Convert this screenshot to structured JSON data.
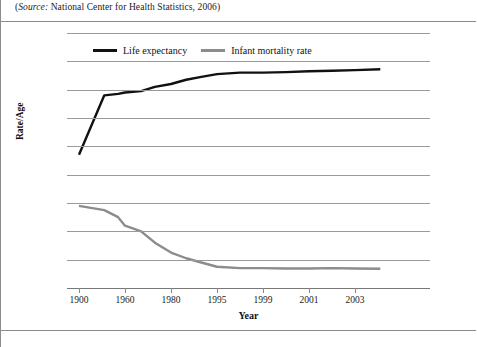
{
  "source_note": {
    "prefix": "(",
    "italic": "Source:",
    "rest": " National Center for Health Statistics, 2006)"
  },
  "legend": {
    "items": [
      {
        "label": "Life expectancy",
        "color": "#111111"
      },
      {
        "label": "Infant mortality rate",
        "color": "#8c8c8c"
      }
    ]
  },
  "chart_data": {
    "type": "line",
    "title": "",
    "xlabel": "Year",
    "ylabel": "Rate/Age",
    "ylim": [
      0,
      90
    ],
    "ytick_labels": [
      "0",
      "10",
      "20",
      "30",
      "40",
      "50",
      "60",
      "70",
      "80",
      "90"
    ],
    "yticks": [
      0,
      10,
      20,
      30,
      40,
      50,
      60,
      70,
      80,
      90
    ],
    "grid": true,
    "legend_position": "top-center",
    "x_axis_type": "categorical",
    "xtick_labels": [
      "1900",
      "1960",
      "1980",
      "1995",
      "1999",
      "2001",
      "2003"
    ],
    "x_categories": [
      "1900",
      "1960",
      "1980",
      "1995",
      "1999",
      "2001",
      "2003"
    ],
    "series": [
      {
        "name": "Life expectancy",
        "color": "#111111",
        "x": [
          "1900",
          "1930",
          "1950",
          "1960",
          "1970",
          "1975",
          "1980",
          "1985",
          "1990",
          "1995",
          "1997",
          "1999",
          "2000",
          "2001",
          "2002",
          "2003",
          "2004"
        ],
        "values": [
          47,
          68,
          68.5,
          69,
          69.5,
          71,
          72,
          73.5,
          74.5,
          75.5,
          76,
          76,
          76.2,
          76.5,
          76.7,
          76.9,
          77.2
        ]
      },
      {
        "name": "Infant mortality rate",
        "color": "#8c8c8c",
        "x": [
          "1900",
          "1930",
          "1950",
          "1960",
          "1970",
          "1975",
          "1980",
          "1985",
          "1990",
          "1995",
          "1997",
          "1999",
          "2000",
          "2001",
          "2002",
          "2003",
          "2004"
        ],
        "values": [
          29,
          27.5,
          25,
          22,
          20,
          16,
          12.5,
          10.5,
          9,
          7.5,
          7,
          7,
          6.9,
          6.9,
          7,
          6.9,
          6.8
        ]
      }
    ]
  }
}
